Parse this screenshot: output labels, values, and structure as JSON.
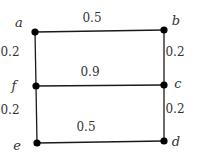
{
  "diagram": {
    "type": "weighted-graph",
    "nodes": [
      {
        "id": "a",
        "label": "a",
        "x": 35,
        "y": 32,
        "lx": 19,
        "ly": 27
      },
      {
        "id": "b",
        "label": "b",
        "x": 164,
        "y": 30,
        "lx": 176,
        "ly": 25
      },
      {
        "id": "c",
        "label": "c",
        "x": 164,
        "y": 85,
        "lx": 178,
        "ly": 88
      },
      {
        "id": "d",
        "label": "d",
        "x": 164,
        "y": 141,
        "lx": 176,
        "ly": 146
      },
      {
        "id": "e",
        "label": "e",
        "x": 37,
        "y": 143,
        "lx": 17,
        "ly": 150
      },
      {
        "id": "f",
        "label": "f",
        "x": 36,
        "y": 86,
        "lx": 14,
        "ly": 90
      }
    ],
    "edges": [
      {
        "id": "ab",
        "from": "a",
        "to": "b",
        "weight": "0.5",
        "wx": 92,
        "wy": 22
      },
      {
        "id": "fc",
        "from": "f",
        "to": "c",
        "weight": "0.9",
        "wx": 90,
        "wy": 76
      },
      {
        "id": "ed",
        "from": "e",
        "to": "d",
        "weight": "0.5",
        "wx": 86,
        "wy": 131
      },
      {
        "id": "af",
        "from": "a",
        "to": "f",
        "weight": "0.2",
        "wx": 10,
        "wy": 56
      },
      {
        "id": "fe",
        "from": "f",
        "to": "e",
        "weight": "0.2",
        "wx": 10,
        "wy": 114
      },
      {
        "id": "bc",
        "from": "b",
        "to": "c",
        "weight": "0.2",
        "wx": 175,
        "wy": 56
      },
      {
        "id": "cd",
        "from": "c",
        "to": "d",
        "weight": "0.2",
        "wx": 175,
        "wy": 113
      }
    ]
  }
}
